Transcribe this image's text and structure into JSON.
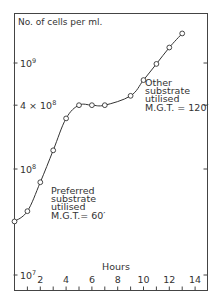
{
  "chart_data": {
    "type": "line",
    "title": "",
    "ylabel": "No. of cells per ml.",
    "xlabel": "Hours",
    "yscale": "log",
    "ylim": [
      7000000,
      2500000000
    ],
    "xlim": [
      0,
      14.8
    ],
    "grid": false,
    "legend": null,
    "x_ticks": [
      "2",
      "4",
      "6",
      "8",
      "10",
      "12",
      "14"
    ],
    "x_minor_ticks": [
      1,
      2,
      3,
      4,
      5,
      6,
      7,
      8,
      9,
      10,
      11,
      12,
      13,
      14
    ],
    "y_ticks": [
      {
        "value": 10000000,
        "base": "10",
        "exp": "7",
        "prefix": ""
      },
      {
        "value": 100000000,
        "base": "10",
        "exp": "8",
        "prefix": ""
      },
      {
        "value": 400000000,
        "base": "10",
        "exp": "8",
        "prefix": "4 × "
      },
      {
        "value": 1000000000,
        "base": "10",
        "exp": "9",
        "prefix": ""
      }
    ],
    "series": [
      {
        "name": "Diauxic growth",
        "marker": "open-circle",
        "x": [
          0,
          1,
          2,
          3,
          4,
          5,
          6,
          7,
          9,
          10,
          11,
          12,
          13
        ],
        "values": [
          32000000,
          40000000,
          75000000,
          150000000,
          300000000,
          400000000,
          400000000,
          400000000,
          490000000,
          690000000,
          980000000,
          1400000000,
          1900000000
        ]
      }
    ],
    "annotations": [
      {
        "lines": [
          "Preferred",
          "substrate",
          "utilised",
          "M.G.T.= 60′"
        ],
        "anchor_x_hours": 2.8,
        "near_value": 60000000
      },
      {
        "lines": [
          "Other",
          "substrate",
          "utilised",
          "M.G.T. = 120′"
        ],
        "anchor_x_hours": 10.2,
        "near_value": 700000000
      }
    ]
  },
  "labels": {
    "ylabel": "No. of cells per ml.",
    "xlabel": "Hours",
    "ann1": [
      "Preferred",
      "substrate",
      "utilised",
      "M.G.T.= 60′"
    ],
    "ann2": [
      "Other",
      "substrate",
      "utilised",
      "M.G.T. = 120′"
    ]
  },
  "colors": {
    "line": "#333333",
    "frame": "#444444",
    "marker_fill": "#ffffff",
    "background": "#ffffff"
  }
}
